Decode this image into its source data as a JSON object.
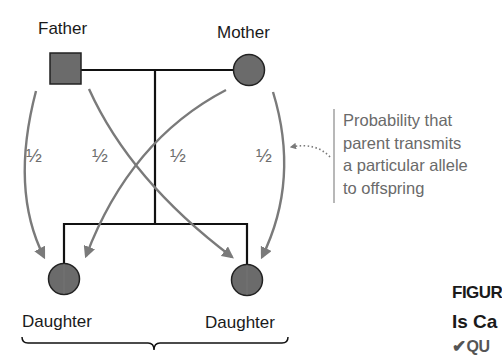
{
  "diagram": {
    "type": "pedigree",
    "parents": {
      "father": {
        "label": "Father",
        "symbol": "square"
      },
      "mother": {
        "label": "Mother",
        "symbol": "circle"
      }
    },
    "offspring": [
      {
        "label": "Daughter",
        "symbol": "circle"
      },
      {
        "label": "Daughter",
        "symbol": "circle"
      }
    ],
    "transmission_probabilities": [
      "½",
      "½",
      "½",
      "½"
    ],
    "callout": {
      "lines": [
        "Probability that",
        "parent transmits",
        "a particular allele",
        "to offspring"
      ]
    },
    "figure_caption": {
      "label": "FIGUR",
      "title": "Is Ca",
      "question_marker": "QU"
    },
    "colors": {
      "symbol_fill": "#6b6b6b",
      "line": "#111111",
      "arrow": "#7a7a7a",
      "callout_bar": "#b8b8b8"
    }
  }
}
